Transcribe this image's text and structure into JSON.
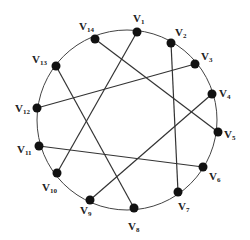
{
  "diagram": {
    "type": "circle-graph",
    "circle": {
      "cx": 127,
      "cy": 120,
      "r": 90,
      "stroke": "#444444"
    },
    "vertices": [
      {
        "id": "v1",
        "label": "V",
        "sub": "1",
        "x": 137,
        "y": 32,
        "lx": 133,
        "ly": 22
      },
      {
        "id": "v2",
        "label": "V",
        "sub": "2",
        "x": 171,
        "y": 43,
        "lx": 175,
        "ly": 36
      },
      {
        "id": "v3",
        "label": "V",
        "sub": "3",
        "x": 195,
        "y": 64,
        "lx": 201,
        "ly": 60
      },
      {
        "id": "v4",
        "label": "V",
        "sub": "4",
        "x": 212,
        "y": 94,
        "lx": 219,
        "ly": 97
      },
      {
        "id": "v5",
        "label": "V",
        "sub": "5",
        "x": 218,
        "y": 132,
        "lx": 224,
        "ly": 138
      },
      {
        "id": "v6",
        "label": "V",
        "sub": "6",
        "x": 203,
        "y": 167,
        "lx": 209,
        "ly": 180
      },
      {
        "id": "v7",
        "label": "V",
        "sub": "7",
        "x": 178,
        "y": 192,
        "lx": 178,
        "ly": 210
      },
      {
        "id": "v8",
        "label": "V",
        "sub": "8",
        "x": 134,
        "y": 208,
        "lx": 128,
        "ly": 230
      },
      {
        "id": "v9",
        "label": "V",
        "sub": "9",
        "x": 90,
        "y": 200,
        "lx": 80,
        "ly": 214
      },
      {
        "id": "v10",
        "label": "V",
        "sub": "10",
        "x": 57,
        "y": 173,
        "lx": 42,
        "ly": 191
      },
      {
        "id": "v11",
        "label": "V",
        "sub": "11",
        "x": 39,
        "y": 146,
        "lx": 17,
        "ly": 153
      },
      {
        "id": "v12",
        "label": "V",
        "sub": "12",
        "x": 37,
        "y": 108,
        "lx": 15,
        "ly": 112
      },
      {
        "id": "v13",
        "label": "V",
        "sub": "13",
        "x": 56,
        "y": 66,
        "lx": 32,
        "ly": 63
      },
      {
        "id": "v14",
        "label": "V",
        "sub": "14",
        "x": 95,
        "y": 39,
        "lx": 79,
        "ly": 30
      }
    ],
    "edges": [
      {
        "from": "v14",
        "to": "v5"
      },
      {
        "from": "v13",
        "to": "v8"
      },
      {
        "from": "v12",
        "to": "v3"
      },
      {
        "from": "v1",
        "to": "v10"
      },
      {
        "from": "v2",
        "to": "v7"
      },
      {
        "from": "v4",
        "to": "v9"
      },
      {
        "from": "v11",
        "to": "v6"
      }
    ],
    "node_color": "#111111",
    "edge_color": "#333333"
  }
}
